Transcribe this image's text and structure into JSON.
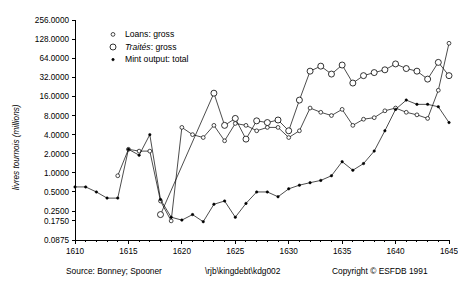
{
  "chart_data": {
    "type": "line",
    "title": "",
    "xlabel": "",
    "ylabel": "livres tournois (millions)",
    "y_scale": "log",
    "ylim": [
      0.0875,
      256
    ],
    "xlim": [
      1610,
      1645
    ],
    "grid": false,
    "legend_position": "top-left",
    "y_ticklabels": [
      "256.0000",
      "128.0000",
      "64.0000",
      "32.0000",
      "16.0000",
      "8.0000",
      "4.0000",
      "2.0000",
      "1.0000",
      "0.5000",
      "0.2500",
      "0.1750",
      "0.0875"
    ],
    "y_tickvalues": [
      256,
      128,
      64,
      32,
      16,
      8,
      4,
      2,
      1,
      0.5,
      0.25,
      0.175,
      0.0875
    ],
    "x_ticklabels": [
      "1610",
      "1615",
      "1620",
      "1625",
      "1630",
      "1635",
      "1640",
      "1645"
    ],
    "x_tickvalues": [
      1610,
      1615,
      1620,
      1625,
      1630,
      1635,
      1640,
      1645
    ],
    "x_minor_step": 1,
    "series": [
      {
        "name": "Loans: gross",
        "marker": "open-circle-small",
        "x": [
          1614,
          1615,
          1616,
          1617,
          1618,
          1619,
          1620,
          1621,
          1622,
          1623,
          1624,
          1625,
          1626,
          1627,
          1628,
          1629,
          1630,
          1631,
          1632,
          1633,
          1634,
          1635,
          1636,
          1637,
          1638,
          1639,
          1640,
          1641,
          1642,
          1643,
          1644,
          1645
        ],
        "values": [
          0.9,
          2.35,
          2.2,
          2.2,
          0.36,
          0.175,
          5.2,
          4.0,
          3.6,
          5.6,
          3.2,
          6.0,
          5.6,
          4.6,
          5.2,
          5.2,
          3.6,
          4.6,
          10.5,
          9.0,
          8.0,
          10.0,
          5.6,
          7.0,
          7.4,
          9.5,
          10.5,
          9.0,
          8.2,
          7.2,
          20.0,
          110.0
        ]
      },
      {
        "name": "Traités: gross",
        "marker": "open-circle-large",
        "x": [
          1618,
          1623,
          1624,
          1625,
          1626,
          1627,
          1628,
          1629,
          1630,
          1631,
          1632,
          1633,
          1634,
          1635,
          1636,
          1637,
          1638,
          1639,
          1640,
          1641,
          1642,
          1643,
          1644,
          1645
        ],
        "values": [
          0.22,
          18.0,
          5.6,
          7.2,
          3.4,
          6.6,
          6.2,
          6.8,
          4.6,
          14.0,
          40.0,
          48.0,
          36.0,
          50.0,
          26.0,
          34.0,
          38.0,
          42.0,
          52.0,
          44.0,
          40.0,
          30.0,
          55.0,
          34.0
        ]
      },
      {
        "name": "Mint output: total",
        "marker": "filled-dot",
        "x": [
          1610,
          1611,
          1612,
          1613,
          1614,
          1615,
          1616,
          1617,
          1618,
          1619,
          1620,
          1621,
          1622,
          1623,
          1624,
          1625,
          1626,
          1627,
          1628,
          1629,
          1630,
          1631,
          1632,
          1633,
          1634,
          1635,
          1636,
          1637,
          1638,
          1639,
          1640,
          1641,
          1642,
          1643,
          1644,
          1645
        ],
        "values": [
          0.6,
          0.6,
          0.5,
          0.4,
          0.4,
          2.35,
          1.9,
          4.0,
          0.38,
          0.2,
          0.18,
          0.22,
          0.17,
          0.32,
          0.36,
          0.2,
          0.33,
          0.5,
          0.5,
          0.42,
          0.56,
          0.64,
          0.7,
          0.76,
          0.9,
          1.5,
          1.1,
          1.4,
          2.2,
          4.6,
          10.0,
          14.0,
          12.0,
          12.0,
          11.0,
          6.2
        ]
      }
    ]
  },
  "legend": {
    "items": [
      {
        "label": "Loans: gross",
        "marker": "open-circle-small",
        "italic_part": ""
      },
      {
        "label_italic": "Traités",
        "label_rest": ": gross",
        "marker": "open-circle-large"
      },
      {
        "label": "Mint output: total",
        "marker": "filled-dot"
      }
    ]
  },
  "footer": {
    "source": "Source: Bonney; Spooner",
    "path": "\\rjb\\kingdebt\\kdg002",
    "copyright": "Copyright © ESFDB 1991"
  }
}
